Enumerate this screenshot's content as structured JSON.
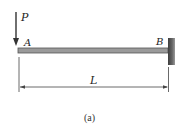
{
  "diagram": {
    "type": "cantilever-beam",
    "load": {
      "label": "P",
      "direction": "down",
      "location": "A"
    },
    "points": {
      "free_end": "A",
      "fixed_end": "B"
    },
    "dimension": {
      "label": "L",
      "from": "A",
      "to": "B"
    },
    "caption": "(a)",
    "colors": {
      "beam_fill": "#9a9a9a",
      "beam_stroke": "#555555",
      "wall_fill": "#555555",
      "line": "#333333"
    }
  }
}
